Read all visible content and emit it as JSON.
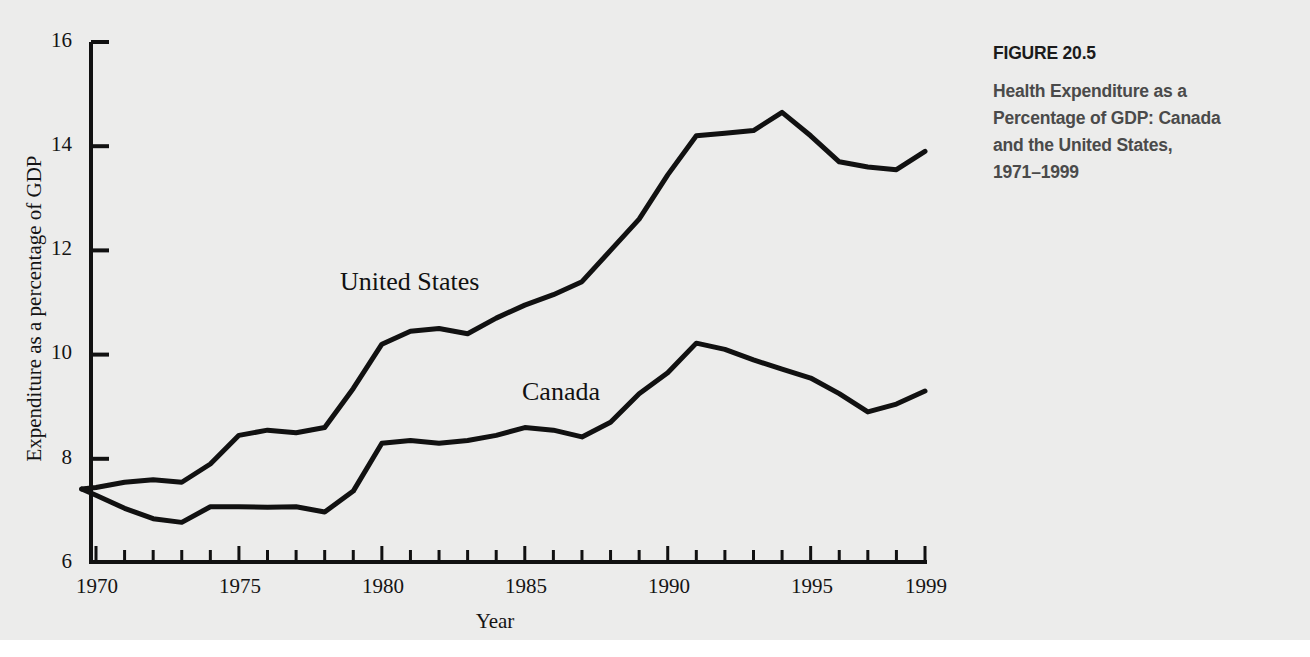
{
  "caption": {
    "figure_number": "FIGURE 20.5",
    "title_lines": [
      "Health Expenditure as a",
      "Percentage of GDP: Canada",
      "and the United States,",
      "1971–1999"
    ],
    "figure_number_color": "#1b1b1b",
    "title_color": "#4a4a4a"
  },
  "page": {
    "background_color": "#ececeb"
  },
  "axes": {
    "x_title": "Year",
    "y_title": "Expenditure as a percentage of GDP",
    "x_tick_labels": [
      "1970",
      "1975",
      "1980",
      "1985",
      "1990",
      "1995",
      "1999"
    ],
    "y_tick_labels": [
      "6",
      "8",
      "10",
      "12",
      "14",
      "16"
    ]
  },
  "chart_data": {
    "type": "line",
    "xlabel": "Year",
    "ylabel": "Expenditure as a percentage of GDP",
    "xlim": [
      1969.5,
      1999
    ],
    "ylim": [
      6,
      16
    ],
    "xticks": [
      1970,
      1975,
      1980,
      1985,
      1990,
      1995,
      1999
    ],
    "xtick_minor_step": 1,
    "yticks": [
      6,
      8,
      10,
      12,
      14,
      16
    ],
    "grid": false,
    "legend": "inline-annotations",
    "line_color": "#111111",
    "annotations": [
      {
        "text": "United States",
        "x": 1979.5,
        "y": 11.5
      },
      {
        "text": "Canada",
        "x": 1985.6,
        "y": 9.35
      }
    ],
    "x": [
      1969.5,
      1970,
      1971,
      1972,
      1973,
      1974,
      1975,
      1976,
      1977,
      1978,
      1979,
      1980,
      1981,
      1982,
      1983,
      1984,
      1985,
      1986,
      1987,
      1988,
      1989,
      1990,
      1991,
      1992,
      1993,
      1994,
      1995,
      1996,
      1997,
      1998,
      1999
    ],
    "series": [
      {
        "name": "United States",
        "values": [
          7.42,
          7.45,
          7.55,
          7.6,
          7.55,
          7.9,
          8.45,
          8.55,
          8.5,
          8.6,
          9.35,
          10.2,
          10.45,
          10.5,
          10.4,
          10.7,
          10.95,
          11.15,
          11.4,
          12.0,
          12.6,
          13.45,
          14.2,
          14.25,
          14.3,
          14.65,
          14.2,
          13.7,
          13.6,
          13.55,
          13.9
        ]
      },
      {
        "name": "Canada",
        "values": [
          7.42,
          7.3,
          7.05,
          6.85,
          6.78,
          7.08,
          7.08,
          7.07,
          7.08,
          6.98,
          7.38,
          8.3,
          8.35,
          8.3,
          8.35,
          8.45,
          8.6,
          8.55,
          8.42,
          8.7,
          9.25,
          9.65,
          10.22,
          10.1,
          9.9,
          9.72,
          9.55,
          9.25,
          8.9,
          9.05,
          9.3
        ]
      }
    ]
  }
}
